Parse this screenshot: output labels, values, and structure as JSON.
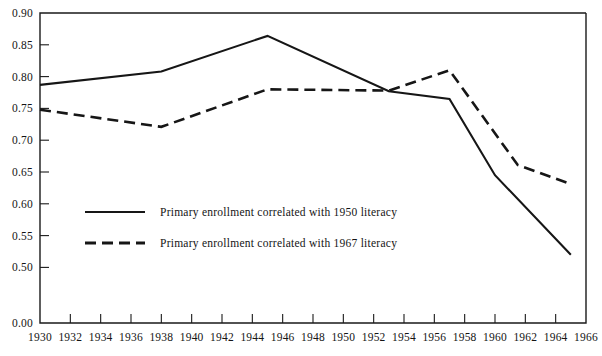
{
  "chart_data": {
    "type": "line",
    "title": "",
    "subtitle": "",
    "xlabel": "",
    "ylabel": "",
    "xlim": [
      1930,
      1966
    ],
    "ylim": [
      0.47,
      0.9
    ],
    "grid": false,
    "axis_break": true,
    "legend_position": "inside-lower-left",
    "x_ticks": [
      1930,
      1932,
      1934,
      1936,
      1938,
      1940,
      1942,
      1944,
      1946,
      1948,
      1950,
      1952,
      1954,
      1956,
      1958,
      1960,
      1962,
      1964,
      1966
    ],
    "x_tick_labels": [
      "1930",
      "1932",
      "1934",
      "1936",
      "1938",
      "1940",
      "1942",
      "1944",
      "1946",
      "1948",
      "1950",
      "1952",
      "1954",
      "1956",
      "1958",
      "1960",
      "1962",
      "1964",
      "1966"
    ],
    "y_ticks": [
      0.9,
      0.85,
      0.8,
      0.75,
      0.7,
      0.65,
      0.6,
      0.55,
      0.5,
      0.0
    ],
    "y_tick_labels": [
      "0.90",
      "0.85",
      "0.80",
      "0.75",
      "0.70",
      "0.65",
      "0.60",
      "0.55",
      "0.50",
      "0.00"
    ],
    "series": [
      {
        "name": "Primary enrollment correlated with 1950 literacy",
        "style": "solid",
        "color": "#161616",
        "x": [
          1930,
          1938,
          1945,
          1953,
          1957,
          1960,
          1965
        ],
        "values": [
          0.787,
          0.808,
          0.864,
          0.777,
          0.765,
          0.645,
          0.52
        ]
      },
      {
        "name": "Primary enrollment correlated with 1967 literacy",
        "style": "dashed",
        "color": "#161616",
        "x": [
          1930,
          1938,
          1945,
          1953,
          1957,
          1961.5,
          1965
        ],
        "values": [
          0.748,
          0.721,
          0.78,
          0.778,
          0.81,
          0.661,
          0.631
        ]
      }
    ]
  },
  "legend": {
    "items": [
      {
        "label": "Primary enrollment correlated with 1950 literacy",
        "style": "solid"
      },
      {
        "label": "Primary enrollment correlated with 1967 literacy",
        "style": "dashed"
      }
    ]
  }
}
